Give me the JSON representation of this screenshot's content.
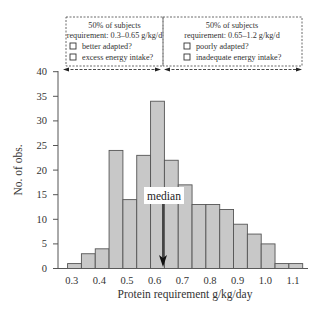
{
  "chart_data": {
    "type": "bar",
    "title": "",
    "xlabel": "Protein requirement g/kg/day",
    "ylabel": "No. of obs.",
    "x": [
      0.3,
      0.35,
      0.4,
      0.45,
      0.5,
      0.55,
      0.6,
      0.65,
      0.7,
      0.75,
      0.8,
      0.85,
      0.9,
      0.95,
      1.0,
      1.05,
      1.1
    ],
    "values": [
      1,
      3,
      4,
      24,
      14,
      23,
      34,
      22,
      17,
      13,
      13,
      12,
      9,
      7,
      5,
      1,
      1
    ],
    "bin_width": 0.05,
    "xlim": [
      0.25,
      1.15
    ],
    "ylim": [
      0,
      40
    ],
    "xticks": [
      "0.3",
      "0.4",
      "0.5",
      "0.6",
      "0.7",
      "0.8",
      "0.9",
      "1.0",
      "1.1"
    ],
    "xtick_values": [
      0.3,
      0.4,
      0.5,
      0.6,
      0.7,
      0.8,
      0.9,
      1.0,
      1.1
    ],
    "yticks": [
      "0",
      "5",
      "10",
      "15",
      "20",
      "25",
      "30",
      "35",
      "40"
    ],
    "ytick_values": [
      0,
      5,
      10,
      15,
      20,
      25,
      30,
      35,
      40
    ],
    "grid": false,
    "bar_fill": "#c8c8c8",
    "bar_stroke": "#555555",
    "median": {
      "label": "median",
      "value": 0.64
    },
    "annotations": [
      {
        "range": [
          0.3,
          0.65
        ],
        "lines": [
          "50% of subjects",
          "requirement: 0.3–0.65 g/kg/d"
        ],
        "checkboxes": [
          "better adapted?",
          "excess energy intake?"
        ]
      },
      {
        "range": [
          0.65,
          1.2
        ],
        "lines": [
          "50% of subjects",
          "requirement: 0.65–1.2 g/kg/d"
        ],
        "checkboxes": [
          "poorly adapted?",
          "inadequate energy intake?"
        ]
      }
    ]
  }
}
